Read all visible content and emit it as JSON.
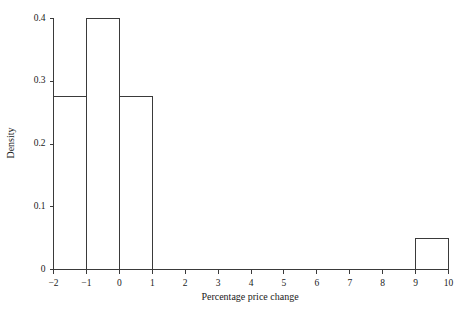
{
  "chart_data": {
    "type": "bar",
    "title": "",
    "subtitle": "",
    "xlabel": "Percentage price change",
    "ylabel": "Density",
    "xlim": [
      -2,
      10
    ],
    "ylim": [
      0,
      0.4
    ],
    "grid": false,
    "legend": null,
    "bin_width": 1,
    "bin_edges": [
      -2,
      -1,
      0,
      1,
      2,
      3,
      4,
      5,
      6,
      7,
      8,
      9,
      10
    ],
    "categories": [
      "-2 to -1",
      "-1 to 0",
      "0 to 1",
      "1 to 2",
      "2 to 3",
      "3 to 4",
      "4 to 5",
      "5 to 6",
      "6 to 7",
      "7 to 8",
      "8 to 9",
      "9 to 10"
    ],
    "values": [
      0.275,
      0.4,
      0.275,
      0,
      0,
      0,
      0,
      0,
      0,
      0,
      0,
      0.05
    ],
    "bars": [
      {
        "x0": -2,
        "x1": -1,
        "density": 0.275
      },
      {
        "x0": -1,
        "x1": 0,
        "density": 0.4
      },
      {
        "x0": 0,
        "x1": 1,
        "density": 0.275
      },
      {
        "x0": 9,
        "x1": 10,
        "density": 0.05
      }
    ],
    "xticks": [
      -2,
      -1,
      0,
      1,
      2,
      3,
      4,
      5,
      6,
      7,
      8,
      9,
      10
    ],
    "xtick_labels": [
      "−2",
      "−1",
      "0",
      "1",
      "2",
      "3",
      "4",
      "5",
      "6",
      "7",
      "8",
      "9",
      "10"
    ],
    "yticks": [
      0,
      0.1,
      0.2,
      0.3,
      0.4
    ],
    "ytick_labels": [
      "0",
      "0.1",
      "0.2",
      "0.3",
      "0.4"
    ],
    "colors": {
      "bar_edge": "#3a3a3a",
      "bar_fill": "#ffffff",
      "axis": "#3a3a3a",
      "text": "#1a1a1a",
      "background": "#ffffff"
    }
  }
}
